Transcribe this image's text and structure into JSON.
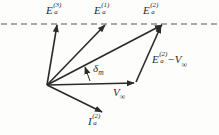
{
  "diagram": {
    "background": "#fdfdfc",
    "line_color": "#2b2b2b",
    "dashed_line_color": "#8d8d8d",
    "dashed_line": {
      "x1": 1,
      "y": 24,
      "x2": 218,
      "dash": "6 4"
    },
    "origin": {
      "x": 47,
      "y": 85
    },
    "vectors": [
      {
        "name": "vector-E-a-3",
        "x1": 47,
        "y1": 85,
        "x2": 57,
        "y2": 25,
        "thin": false
      },
      {
        "name": "vector-E-a-1",
        "x1": 47,
        "y1": 85,
        "x2": 105,
        "y2": 25,
        "thin": false
      },
      {
        "name": "vector-E-a-2",
        "x1": 47,
        "y1": 85,
        "x2": 162,
        "y2": 25,
        "thin": false
      },
      {
        "name": "vector-V-infinity",
        "x1": 47,
        "y1": 85,
        "x2": 134,
        "y2": 83,
        "thin": false
      },
      {
        "name": "vector-E-a-2-minus-V",
        "x1": 136,
        "y1": 82,
        "x2": 161,
        "y2": 26,
        "thin": false
      },
      {
        "name": "vector-I-a-2",
        "x1": 47,
        "y1": 85,
        "x2": 102,
        "y2": 112,
        "thin": false
      },
      {
        "name": "delta-angle-pointer",
        "x1": 90,
        "y1": 81,
        "x2": 85,
        "y2": 67,
        "thin": true
      }
    ],
    "labels": [
      {
        "name": "label-E-a-3",
        "x": 46,
        "y": 3,
        "parts": [
          {
            "k": "base",
            "t": "E"
          },
          {
            "k": "stack",
            "sup": "(3)",
            "sub": "a"
          }
        ]
      },
      {
        "name": "label-E-a-1",
        "x": 94,
        "y": 3,
        "parts": [
          {
            "k": "base",
            "t": "E"
          },
          {
            "k": "stack",
            "sup": "(1)",
            "sub": "a"
          }
        ]
      },
      {
        "name": "label-E-a-2",
        "x": 143,
        "y": 3,
        "parts": [
          {
            "k": "base",
            "t": "E"
          },
          {
            "k": "stack",
            "sup": "(2)",
            "sub": "a"
          }
        ]
      },
      {
        "name": "label-E-a-2-minus-V",
        "x": 152,
        "y": 52,
        "parts": [
          {
            "k": "base",
            "t": "E"
          },
          {
            "k": "stack",
            "sup": "(2)",
            "sub": "a"
          },
          {
            "k": "base",
            "t": " − "
          },
          {
            "k": "base",
            "t": "V"
          },
          {
            "k": "sub",
            "t": "∞"
          }
        ]
      },
      {
        "name": "label-delta-m",
        "x": 93,
        "y": 63,
        "parts": [
          {
            "k": "base",
            "t": "δ"
          },
          {
            "k": "sub",
            "t": "m"
          }
        ]
      },
      {
        "name": "label-V-infinity",
        "x": 113,
        "y": 87,
        "parts": [
          {
            "k": "base",
            "t": "V"
          },
          {
            "k": "sub",
            "t": "∞"
          }
        ]
      },
      {
        "name": "label-I-a-2",
        "x": 88,
        "y": 114,
        "parts": [
          {
            "k": "base",
            "t": "I"
          },
          {
            "k": "stack",
            "sup": "(2)",
            "sub": "a"
          }
        ]
      }
    ]
  }
}
